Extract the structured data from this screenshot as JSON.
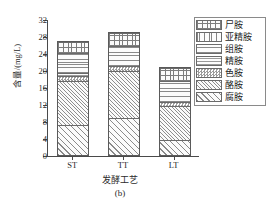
{
  "chart_data": {
    "type": "bar",
    "stacked": true,
    "title": "",
    "subtitle": "(b)",
    "xlabel": "发酵工艺",
    "ylabel": "含量/(mg/L)",
    "categories": [
      "ST",
      "TT",
      "LT"
    ],
    "ylim": [
      0,
      32
    ],
    "yticks": [
      0,
      4,
      8,
      12,
      16,
      20,
      24,
      28,
      32
    ],
    "grid": false,
    "legend_position": "right",
    "series": [
      {
        "name": "尸胺",
        "pattern": "grid",
        "values": [
          2.5,
          3.0,
          3.2
        ]
      },
      {
        "name": "亚精胺",
        "pattern": "vertical",
        "values": [
          0.0,
          0.0,
          0.0
        ]
      },
      {
        "name": "组胺",
        "pattern": "horizontal",
        "values": [
          4.7,
          4.7,
          4.8
        ]
      },
      {
        "name": "精胺",
        "pattern": "horizontal-light",
        "values": [
          0.6,
          0.0,
          0.0
        ]
      },
      {
        "name": "色胺",
        "pattern": "checker",
        "values": [
          1.4,
          1.2,
          1.0
        ]
      },
      {
        "name": "酪胺",
        "pattern": "diagonal-dense",
        "values": [
          10.3,
          10.9,
          8.0
        ]
      },
      {
        "name": "腐胺",
        "pattern": "diagonal",
        "values": [
          7.0,
          8.8,
          3.5
        ]
      }
    ],
    "totals": [
      26.5,
      28.6,
      20.5
    ],
    "stack_order_bottom_to_top": [
      "腐胺",
      "酪胺",
      "色胺",
      "精胺",
      "组胺",
      "亚精胺",
      "尸胺"
    ]
  },
  "axis": {
    "y_labels": [
      "32",
      "28",
      "24",
      "20",
      "16",
      "12",
      "8",
      "4",
      "0"
    ],
    "x_labels": [
      "ST",
      "TT",
      "LT"
    ]
  },
  "legend": {
    "items": [
      {
        "label": "尸胺"
      },
      {
        "label": "亚精胺"
      },
      {
        "label": "组胺"
      },
      {
        "label": "精胺"
      },
      {
        "label": "色胺"
      },
      {
        "label": "酪胺"
      },
      {
        "label": "腐胺"
      }
    ]
  }
}
